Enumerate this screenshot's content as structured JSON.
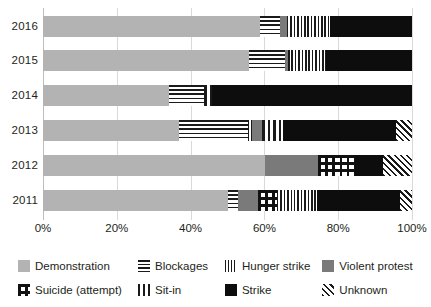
{
  "chart_data": {
    "type": "bar",
    "orientation": "horizontal",
    "stacked": true,
    "normalized_percent": true,
    "title": "",
    "subtitle": "",
    "xlabel": "",
    "ylabel": "",
    "xlim": [
      0,
      100
    ],
    "grid": true,
    "legend_position": "bottom",
    "xticks": [
      "0%",
      "20%",
      "40%",
      "60%",
      "80%",
      "100%"
    ],
    "xtick_values": [
      0,
      20,
      40,
      60,
      80,
      100
    ],
    "categories": [
      "2016",
      "2015",
      "2014",
      "2013",
      "2012",
      "2011"
    ],
    "series": [
      {
        "name": "Demonstration",
        "pattern": "solid-light-grey",
        "color": "#b3b3b3",
        "values": [
          58.8,
          55.8,
          34.1,
          36.9,
          60.2,
          50.1
        ]
      },
      {
        "name": "Blockages",
        "pattern": "horizontal-lines",
        "color": "#1a1a1a",
        "values": [
          5.4,
          9.8,
          9.5,
          18.7,
          0,
          2.7
        ]
      },
      {
        "name": "Hunger strike",
        "pattern": "fine-vertical-lines",
        "color": "#1a1a1a",
        "values": [
          11.7,
          10.3,
          0,
          1.1,
          0,
          10.9
        ]
      },
      {
        "name": "Violent protest",
        "pattern": "solid-dark-grey",
        "color": "#7a7a7a",
        "values": [
          1.9,
          0.8,
          0,
          2.6,
          14.3,
          5.5
        ]
      },
      {
        "name": "Suicide (attempt)",
        "pattern": "checkerboard",
        "color": "#111111",
        "values": [
          0,
          0,
          0,
          0,
          10.1,
          5.1
        ]
      },
      {
        "name": "Sit-in",
        "pattern": "thick-vertical-bars",
        "color": "#1a1a1a",
        "values": [
          0,
          0,
          2.2,
          5.7,
          0,
          0
        ]
      },
      {
        "name": "Strike",
        "pattern": "solid-black",
        "color": "#0d0d0d",
        "values": [
          22.2,
          23.3,
          54.2,
          30.7,
          7.5,
          22.4
        ]
      },
      {
        "name": "Unknown",
        "pattern": "diagonal-hatch",
        "color": "#1a1a1a",
        "values": [
          0,
          0,
          0,
          4.3,
          7.9,
          3.3
        ]
      }
    ],
    "bars": [
      {
        "category": "2016",
        "segments": [
          {
            "series": "Demonstration",
            "value": 58.8
          },
          {
            "series": "Blockages",
            "value": 5.4
          },
          {
            "series": "Violent protest",
            "value": 1.9
          },
          {
            "series": "Hunger strike",
            "value": 11.7
          },
          {
            "series": "Strike",
            "value": 22.2
          }
        ]
      },
      {
        "category": "2015",
        "segments": [
          {
            "series": "Demonstration",
            "value": 55.8
          },
          {
            "series": "Blockages",
            "value": 9.8
          },
          {
            "series": "Violent protest",
            "value": 0.8
          },
          {
            "series": "Hunger strike",
            "value": 10.3
          },
          {
            "series": "Strike",
            "value": 23.3
          }
        ]
      },
      {
        "category": "2014",
        "segments": [
          {
            "series": "Demonstration",
            "value": 34.1
          },
          {
            "series": "Blockages",
            "value": 9.5
          },
          {
            "series": "Sit-in",
            "value": 2.2
          },
          {
            "series": "Strike",
            "value": 54.2
          }
        ]
      },
      {
        "category": "2013",
        "segments": [
          {
            "series": "Demonstration",
            "value": 36.9
          },
          {
            "series": "Blockages",
            "value": 18.7
          },
          {
            "series": "Hunger strike",
            "value": 1.1
          },
          {
            "series": "Violent protest",
            "value": 2.6
          },
          {
            "series": "Sit-in",
            "value": 5.7
          },
          {
            "series": "Strike",
            "value": 30.7
          },
          {
            "series": "Unknown",
            "value": 4.3
          }
        ]
      },
      {
        "category": "2012",
        "segments": [
          {
            "series": "Demonstration",
            "value": 60.2
          },
          {
            "series": "Violent protest",
            "value": 14.3
          },
          {
            "series": "Suicide (attempt)",
            "value": 10.1
          },
          {
            "series": "Strike",
            "value": 7.5
          },
          {
            "series": "Unknown",
            "value": 7.9
          }
        ]
      },
      {
        "category": "2011",
        "segments": [
          {
            "series": "Demonstration",
            "value": 50.1
          },
          {
            "series": "Blockages",
            "value": 2.7
          },
          {
            "series": "Violent protest",
            "value": 5.5
          },
          {
            "series": "Suicide (attempt)",
            "value": 5.1
          },
          {
            "series": "Hunger strike",
            "value": 10.9
          },
          {
            "series": "Strike",
            "value": 22.4
          },
          {
            "series": "Unknown",
            "value": 3.3
          }
        ]
      }
    ]
  },
  "legend": {
    "rows": [
      [
        {
          "label": "Demonstration",
          "pattern": "solid-light-grey"
        },
        {
          "label": "Blockages",
          "pattern": "horizontal-lines"
        },
        {
          "label": "Hunger strike",
          "pattern": "fine-vertical-lines"
        },
        {
          "label": "Violent protest",
          "pattern": "solid-dark-grey"
        }
      ],
      [
        {
          "label": "Suicide (attempt)",
          "pattern": "checkerboard"
        },
        {
          "label": "Sit-in",
          "pattern": "thick-vertical-bars"
        },
        {
          "label": "Strike",
          "pattern": "solid-black"
        },
        {
          "label": "Unknown",
          "pattern": "diagonal-hatch"
        }
      ]
    ]
  },
  "colors": {
    "demonstration": "#b3b3b3",
    "violent_protest": "#7a7a7a",
    "strike": "#0d0d0d",
    "grid": "#d9d9d9",
    "text": "#231f20",
    "background": "#ffffff"
  }
}
